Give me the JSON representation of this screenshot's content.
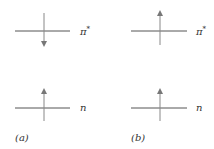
{
  "diagram": {
    "title": "",
    "colors": {
      "line": "#555555",
      "arrow": "#777777",
      "text": "#333333",
      "background": "#ffffff"
    },
    "panels": [
      {
        "id": "a",
        "label": "(a)",
        "levels": [
          {
            "name": "π*",
            "label_main": "π",
            "label_sup": "*",
            "electron_spin": "down"
          },
          {
            "name": "n",
            "label_main": "n",
            "label_sup": "",
            "electron_spin": "up"
          }
        ]
      },
      {
        "id": "b",
        "label": "(b)",
        "levels": [
          {
            "name": "π*",
            "label_main": "π",
            "label_sup": "*",
            "electron_spin": "up"
          },
          {
            "name": "n",
            "label_main": "n",
            "label_sup": "",
            "electron_spin": "up"
          }
        ]
      }
    ]
  }
}
